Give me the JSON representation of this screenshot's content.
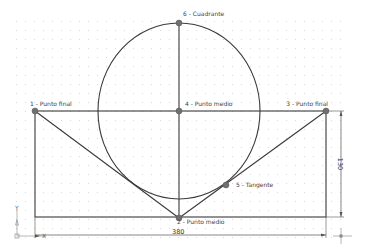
{
  "drawing": {
    "colors": {
      "background": "#ffffff",
      "geometry": "#3a3a3a",
      "point": "#707070",
      "dimension": "#555555",
      "grid": "#d8d8d8",
      "text": "#444444"
    },
    "grid": {
      "spacing": 9,
      "x0": 16,
      "y0": 21,
      "x1": 340,
      "y1": 245
    },
    "rectangle": {
      "x": 35,
      "y": 111,
      "width": 291,
      "height": 106
    },
    "circle": {
      "cx": 179,
      "cy": 111,
      "rx": 81,
      "ry": 88
    },
    "points": [
      {
        "id": "p1",
        "label": "1 - Punto final",
        "x": 35,
        "y": 111,
        "lx": 30,
        "ly": 106,
        "anchor": "start"
      },
      {
        "id": "p2",
        "label": "2 - Punto medio",
        "x": 179,
        "y": 218,
        "lx": 177,
        "ly": 224,
        "anchor": "start"
      },
      {
        "id": "p3",
        "label": "3 - Punto final",
        "x": 326,
        "y": 111,
        "lx": 328,
        "ly": 106,
        "anchor": "end"
      },
      {
        "id": "p4",
        "label": "4 - Punto medio",
        "x": 179,
        "y": 111,
        "lx": 185,
        "ly": 106,
        "anchor": "start"
      },
      {
        "id": "p5",
        "label": "5 - Tangente",
        "x": 226,
        "y": 185,
        "lx": 236,
        "ly": 187,
        "anchor": "start"
      },
      {
        "id": "p6",
        "label": "6 - Cuadrante",
        "x": 179,
        "y": 23,
        "lx": 183,
        "ly": 16,
        "anchor": "start"
      }
    ],
    "dimensions": {
      "horizontal": {
        "value": "380",
        "y": 235,
        "x1": 35,
        "x2": 326
      },
      "vertical": {
        "value": "130",
        "x": 341,
        "y1": 111,
        "y2": 217
      }
    },
    "axes": {
      "x_label": "X",
      "y_label": "Y"
    }
  }
}
